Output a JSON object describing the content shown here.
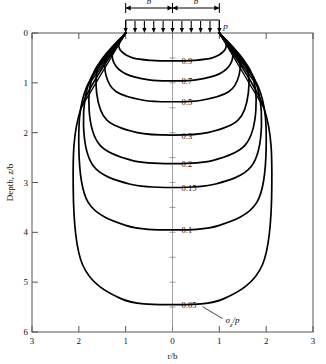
{
  "figure": {
    "kind": "pressure-bulb-contour-plot"
  },
  "axes": {
    "x": {
      "label": "r/b",
      "ticks": [
        "3",
        "2",
        "1",
        "0",
        "1",
        "2",
        "3"
      ],
      "values": [
        -3,
        -2,
        -1,
        0,
        1,
        2,
        3
      ],
      "min": -3,
      "max": 3
    },
    "y": {
      "label": "Depth, z/b",
      "ticks": [
        "0",
        "1",
        "2",
        "3",
        "4",
        "5",
        "6"
      ],
      "values": [
        0,
        1,
        2,
        3,
        4,
        5,
        6
      ],
      "min": 0,
      "max": 6
    }
  },
  "footing": {
    "half_width_label_left": "b",
    "half_width_label_right": "b",
    "pressure_label": "p",
    "left_edge": -1,
    "right_edge": 1,
    "arrow_count": 11
  },
  "annotations": {
    "quantity_symbol": "σ",
    "quantity_sub": "z",
    "quantity_div": "/p"
  },
  "chart_data": {
    "type": "line",
    "title": "",
    "subtitle": "",
    "xlabel": "r/b",
    "ylabel": "Depth, z/b",
    "xlim": [
      -3,
      3
    ],
    "ylim": [
      0,
      6
    ],
    "y_inverted": true,
    "grid": false,
    "legend": "none",
    "contour_variable": "σz/p",
    "labels_position": "centerline",
    "series": [
      {
        "name": "0.9",
        "label": "0.9",
        "center_depth": 0.55,
        "max_half_width": 1.16,
        "width_at_depth": 0.25,
        "points": [
          [
            -1,
            0
          ],
          [
            -1.14,
            0.2
          ],
          [
            -1.1,
            0.36
          ],
          [
            -0.85,
            0.5
          ],
          [
            -0.45,
            0.55
          ],
          [
            0,
            0.56
          ],
          [
            0.45,
            0.55
          ],
          [
            0.85,
            0.5
          ],
          [
            1.1,
            0.36
          ],
          [
            1.14,
            0.2
          ],
          [
            1,
            0
          ]
        ]
      },
      {
        "name": "0.7",
        "label": "0.7",
        "center_depth": 0.95,
        "max_half_width": 1.3,
        "width_at_depth": 0.45,
        "points": [
          [
            -1,
            0
          ],
          [
            -1.26,
            0.32
          ],
          [
            -1.25,
            0.6
          ],
          [
            -1,
            0.82
          ],
          [
            -0.5,
            0.94
          ],
          [
            0,
            0.96
          ],
          [
            0.5,
            0.94
          ],
          [
            1,
            0.82
          ],
          [
            1.25,
            0.6
          ],
          [
            1.26,
            0.32
          ],
          [
            1,
            0
          ]
        ]
      },
      {
        "name": "0.5",
        "label": "0.5",
        "center_depth": 1.38,
        "max_half_width": 1.45,
        "width_at_depth": 0.7,
        "points": [
          [
            -1,
            0
          ],
          [
            -1.4,
            0.45
          ],
          [
            -1.42,
            0.85
          ],
          [
            -1.2,
            1.18
          ],
          [
            -0.62,
            1.35
          ],
          [
            0,
            1.38
          ],
          [
            0.62,
            1.35
          ],
          [
            1.2,
            1.18
          ],
          [
            1.42,
            0.85
          ],
          [
            1.4,
            0.45
          ],
          [
            1,
            0
          ]
        ]
      },
      {
        "name": "0.3",
        "label": "0.3",
        "center_depth": 2.05,
        "max_half_width": 1.62,
        "width_at_depth": 1.05,
        "points": [
          [
            -1,
            0
          ],
          [
            -1.55,
            0.6
          ],
          [
            -1.62,
            1.2
          ],
          [
            -1.4,
            1.75
          ],
          [
            -0.75,
            2.0
          ],
          [
            0,
            2.05
          ],
          [
            0.75,
            2.0
          ],
          [
            1.4,
            1.75
          ],
          [
            1.62,
            1.2
          ],
          [
            1.55,
            0.6
          ],
          [
            1,
            0
          ]
        ]
      },
      {
        "name": "0.2",
        "label": "0.2",
        "center_depth": 2.62,
        "max_half_width": 1.78,
        "width_at_depth": 1.35,
        "points": [
          [
            -1,
            0
          ],
          [
            -1.66,
            0.75
          ],
          [
            -1.78,
            1.55
          ],
          [
            -1.55,
            2.25
          ],
          [
            -0.85,
            2.56
          ],
          [
            0,
            2.62
          ],
          [
            0.85,
            2.56
          ],
          [
            1.55,
            2.25
          ],
          [
            1.78,
            1.55
          ],
          [
            1.66,
            0.75
          ],
          [
            1,
            0
          ]
        ]
      },
      {
        "name": "0.15",
        "label": "0.15",
        "center_depth": 3.1,
        "max_half_width": 1.9,
        "width_at_depth": 1.6,
        "points": [
          [
            -1,
            0
          ],
          [
            -1.74,
            0.9
          ],
          [
            -1.9,
            1.85
          ],
          [
            -1.68,
            2.68
          ],
          [
            -0.92,
            3.03
          ],
          [
            0,
            3.1
          ],
          [
            0.92,
            3.03
          ],
          [
            1.68,
            2.68
          ],
          [
            1.9,
            1.85
          ],
          [
            1.74,
            0.9
          ],
          [
            1,
            0
          ]
        ]
      },
      {
        "name": "0.1",
        "label": "0.1",
        "center_depth": 3.95,
        "max_half_width": 2.0,
        "width_at_depth": 2.0,
        "points": [
          [
            -1,
            0
          ],
          [
            -1.84,
            1.1
          ],
          [
            -2.0,
            2.3
          ],
          [
            -1.8,
            3.4
          ],
          [
            -1.0,
            3.86
          ],
          [
            0,
            3.95
          ],
          [
            1.0,
            3.86
          ],
          [
            1.8,
            3.4
          ],
          [
            2.0,
            2.3
          ],
          [
            1.84,
            1.1
          ],
          [
            1,
            0
          ]
        ]
      },
      {
        "name": "0.05",
        "label": "0.05",
        "center_depth": 5.45,
        "max_half_width": 2.12,
        "width_at_depth": 2.8,
        "points": [
          [
            -1,
            0
          ],
          [
            -1.95,
            1.5
          ],
          [
            -2.12,
            3.1
          ],
          [
            -1.92,
            4.65
          ],
          [
            -1.1,
            5.33
          ],
          [
            0,
            5.45
          ],
          [
            1.1,
            5.33
          ],
          [
            1.92,
            4.65
          ],
          [
            2.12,
            3.1
          ],
          [
            1.95,
            1.5
          ],
          [
            1,
            0
          ]
        ]
      }
    ],
    "label_anchor_depths": {
      "0.9": 0.56,
      "0.7": 0.96,
      "0.5": 1.38,
      "0.3": 2.05,
      "0.2": 2.62,
      "0.15": 3.1,
      "0.1": 3.95,
      "0.05": 5.45
    }
  },
  "colors": {
    "contour": "#000000",
    "axis": "#555555",
    "centerline": "#888888",
    "text": "#111111"
  }
}
